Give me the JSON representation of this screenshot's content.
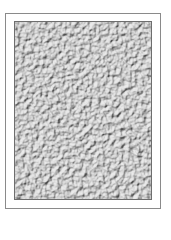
{
  "image": {
    "description": "Gray stucco/pebbled texture swatch inside a thin rectangular frame",
    "colors": {
      "base": "#a8a8a8",
      "light": "#d2d2d2",
      "dark": "#6a6a6a",
      "frame": "#8a8a8a"
    }
  }
}
